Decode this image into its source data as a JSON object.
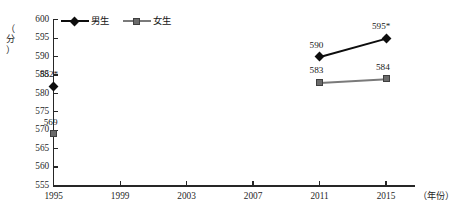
{
  "chart_data": {
    "type": "line",
    "title": "",
    "xlabel": "（年份）",
    "ylabel": "（分）",
    "x": [
      1995,
      1999,
      2003,
      2007,
      2011,
      2015
    ],
    "xticklabels": [
      "1995",
      "1999",
      "2003",
      "2007",
      "2011",
      "2015"
    ],
    "yticks": [
      555,
      560,
      565,
      570,
      575,
      580,
      585,
      590,
      595,
      600
    ],
    "yticklabels": [
      "555",
      "560",
      "565",
      "570",
      "575",
      "580",
      "585",
      "590",
      "595",
      "600"
    ],
    "ylim": [
      555,
      600
    ],
    "grid": false,
    "legend_position": "top-left",
    "series": [
      {
        "name": "男生",
        "marker": "diamond",
        "color": "#0d0d0d",
        "points": [
          {
            "x": 1995,
            "y": 582,
            "label": "582*"
          },
          {
            "x": 2011,
            "y": 590,
            "label": "590"
          },
          {
            "x": 2015,
            "y": 595,
            "label": "595*"
          }
        ],
        "connected_segments": [
          [
            2011,
            2015
          ]
        ]
      },
      {
        "name": "女生",
        "marker": "square",
        "color": "#6b6b6b",
        "points": [
          {
            "x": 1995,
            "y": 569,
            "label": "569"
          },
          {
            "x": 2011,
            "y": 583,
            "label": "583"
          },
          {
            "x": 2015,
            "y": 584,
            "label": "584"
          }
        ],
        "connected_segments": [
          [
            2011,
            2015
          ]
        ]
      }
    ]
  },
  "legend": {
    "items": [
      {
        "label": "男生",
        "marker": "diamond",
        "color": "#0d0d0d"
      },
      {
        "label": "女生",
        "marker": "square",
        "color": "#6b6b6b"
      }
    ]
  },
  "axes": {
    "y_title": "（分）",
    "y_title_chars": [
      "（",
      "分",
      "）"
    ],
    "x_title": "（年份）"
  }
}
